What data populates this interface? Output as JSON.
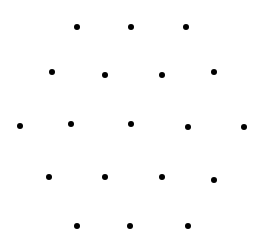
{
  "diagram": {
    "type": "dot-pattern",
    "background": "#ffffff",
    "dot_color": "#000000",
    "dot_radius": 3,
    "rows": [
      [
        [
          77,
          27
        ],
        [
          131,
          27
        ],
        [
          186,
          27
        ]
      ],
      [
        [
          52,
          72
        ],
        [
          105,
          75
        ],
        [
          162,
          75
        ],
        [
          214,
          72
        ]
      ],
      [
        [
          20,
          126
        ],
        [
          71,
          124
        ],
        [
          131,
          124
        ],
        [
          188,
          127
        ],
        [
          244,
          127
        ]
      ],
      [
        [
          49,
          177
        ],
        [
          105,
          177
        ],
        [
          162,
          177
        ],
        [
          214,
          180
        ]
      ],
      [
        [
          77,
          226
        ],
        [
          130,
          226
        ],
        [
          188,
          226
        ]
      ]
    ]
  }
}
